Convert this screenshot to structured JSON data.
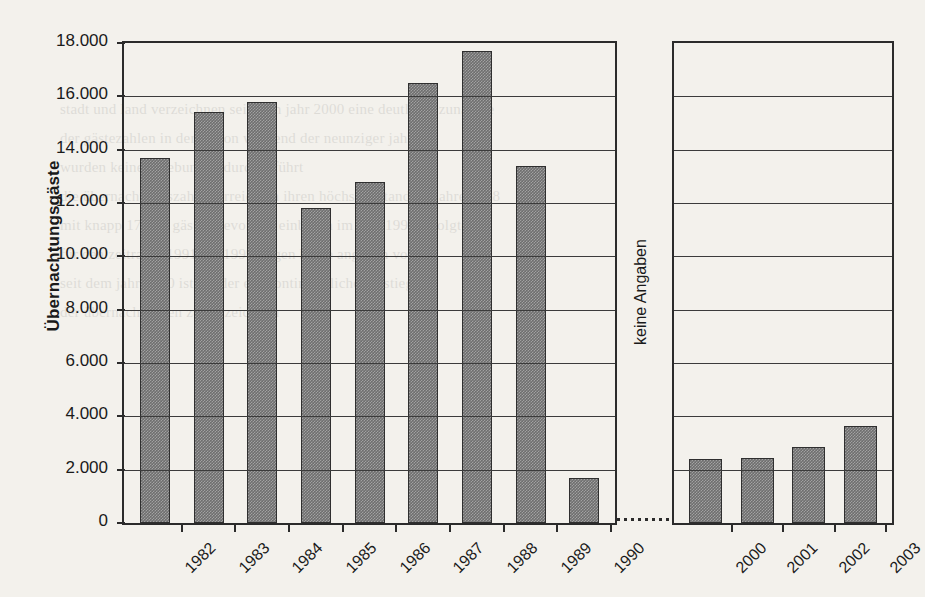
{
  "chart_data": {
    "type": "bar",
    "title": "",
    "subtitle": "",
    "xlabel": "",
    "ylabel": "Übernachtungsgäste",
    "ylim": [
      0,
      18000
    ],
    "ytick_step": 2000,
    "ytick_labels": [
      "0",
      "2.000",
      "4.000",
      "6.000",
      "8.000",
      "10.000",
      "12.000",
      "14.000",
      "16.000",
      "18.000"
    ],
    "ytick_values": [
      0,
      2000,
      4000,
      6000,
      8000,
      10000,
      12000,
      14000,
      16000,
      18000
    ],
    "grid": "horizontal",
    "legend": "none",
    "axis_break": true,
    "annotations": [
      {
        "text": "keine Angaben",
        "orientation": "vertical",
        "position": "between-1990-and-2000"
      }
    ],
    "groups": [
      {
        "name": "1982-1990",
        "categories": [
          "1982",
          "1983",
          "1984",
          "1985",
          "1986",
          "1987",
          "1988",
          "1989",
          "1990"
        ],
        "values": [
          13700,
          15400,
          15800,
          11800,
          12800,
          16500,
          17700,
          13400,
          1700
        ]
      },
      {
        "name": "2000-2003",
        "categories": [
          "2000",
          "2001",
          "2002",
          "2003"
        ],
        "values": [
          2400,
          2450,
          2850,
          3650
        ]
      }
    ],
    "colors": {
      "bar_fill": "#6e6e6e",
      "bar_border": "#2f2f2f",
      "axis": "#2b2b2b",
      "grid": "#3b3b3b",
      "background": "#f3f1ec",
      "text": "#1a1a1a"
    }
  },
  "ghost_text": {
    "lines": [
      "stadt und land verzeichnen seit dem jahr 2000 eine deutliche zunahme",
      "der gästezahlen in der region während der neunziger jahre",
      "wurden keine erhebungen durchgeführt",
      "die übernachtungszahlen erreichten ihren höchsten stand im jahre 1988",
      "mit knapp 17.700 gästen bevor der einbruch im jahr 1990 erfolgte",
      "für den zeitraum 1991 bis 1999 liegen keine angaben vor",
      "seit dem jahr 2000 ist wieder ein kontinuierlicher anstieg",
      "der übernachtungen zu verzeichnen"
    ]
  }
}
